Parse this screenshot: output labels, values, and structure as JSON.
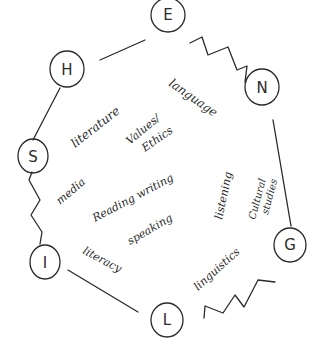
{
  "diagram": {
    "title": "",
    "nodes": [
      {
        "id": "E",
        "label": "E",
        "cx": 168,
        "cy": 15,
        "r": 17
      },
      {
        "id": "N",
        "label": "N",
        "cx": 262,
        "cy": 87,
        "r": 17
      },
      {
        "id": "G",
        "label": "G",
        "cx": 290,
        "cy": 245,
        "r": 16
      },
      {
        "id": "L",
        "label": "L",
        "cx": 167,
        "cy": 320,
        "r": 16
      },
      {
        "id": "I",
        "label": "I",
        "cx": 45,
        "cy": 262,
        "r": 15
      },
      {
        "id": "S",
        "label": "S",
        "cx": 33,
        "cy": 156,
        "r": 15
      },
      {
        "id": "H",
        "label": "H",
        "cx": 67,
        "cy": 69,
        "r": 17
      }
    ],
    "edges": [
      {
        "from": "E",
        "to": "N",
        "style": "zigzag"
      },
      {
        "from": "N",
        "to": "G",
        "style": "straight"
      },
      {
        "from": "G",
        "to": "L",
        "style": "zigzag-detached"
      },
      {
        "from": "L",
        "to": "I",
        "style": "straight"
      },
      {
        "from": "I",
        "to": "S",
        "style": "zigzag"
      },
      {
        "from": "S",
        "to": "H",
        "style": "straight"
      },
      {
        "from": "H",
        "to": "E",
        "style": "straight"
      }
    ],
    "words": {
      "language": "language",
      "literature": "literature",
      "values": "Values/",
      "ethics": "Ethics",
      "media": "media",
      "reading_writing": "Reading writing",
      "speaking": "speaking",
      "listening": "listening",
      "cultural": "Cultural",
      "studies": "studies",
      "literacy": "literacy",
      "linguistics": "linguistics"
    }
  }
}
